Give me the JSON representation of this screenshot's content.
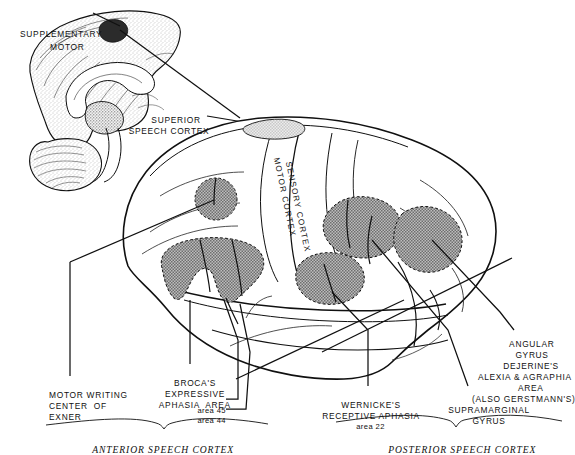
{
  "figure": {
    "background_color": "#ffffff",
    "ink_color": "#101010",
    "shade_color": "#9a9a9a",
    "light_shade_color": "#d8d8d8"
  },
  "labels": {
    "supplementary_motor_line1": "SUPPLEMENTARY",
    "supplementary_motor_line2": "MOTOR",
    "superior_speech_line1": "SUPERIOR",
    "superior_speech_line2": "SPEECH CORTEX",
    "motor_cortex": "MOTOR CORTEX",
    "sensory_cortex": "SENSORY CORTEX",
    "motor_writing_line1": "MOTOR WRITING",
    "motor_writing_line2": "CENTER  OF",
    "motor_writing_line3": "EXNER",
    "brocas_line1": "BROCA'S",
    "brocas_line2": "EXPRESSIVE",
    "brocas_line3": "APHASIA  AREA",
    "area_45": "area 45",
    "area_44": "area 44",
    "wernicke_line1": "WERNICKE'S",
    "wernicke_line2": "RECEPTIVE APHASIA",
    "area_22": "area 22",
    "supramarginal_line1": "SUPRAMARGINAL",
    "supramarginal_line2": "GYRUS",
    "angular_line1": "ANGULAR",
    "angular_line2": "GYRUS",
    "angular_line3": "DEJERINE'S",
    "angular_line4": "ALEXIA & AGRAPHIA",
    "angular_line5": "AREA",
    "angular_line6": "(ALSO GERSTMANN'S)",
    "anterior_speech_cortex": "ANTERIOR SPEECH CORTEX",
    "posterior_speech_cortex": "POSTERIOR SPEECH CORTEX"
  },
  "regions": [
    {
      "name": "supplementary-motor-area",
      "view": "medial",
      "shading": "dark"
    },
    {
      "name": "superior-speech-cortex-area",
      "view": "lateral",
      "shading": "light"
    },
    {
      "name": "exner-writing-center-area",
      "view": "lateral",
      "shading": "stipple"
    },
    {
      "name": "brocas-area",
      "view": "lateral",
      "shading": "stipple"
    },
    {
      "name": "supramarginal-gyrus-area",
      "view": "lateral",
      "shading": "stipple"
    },
    {
      "name": "angular-gyrus-area",
      "view": "lateral",
      "shading": "stipple"
    },
    {
      "name": "wernickes-area",
      "view": "lateral",
      "shading": "stipple"
    }
  ]
}
